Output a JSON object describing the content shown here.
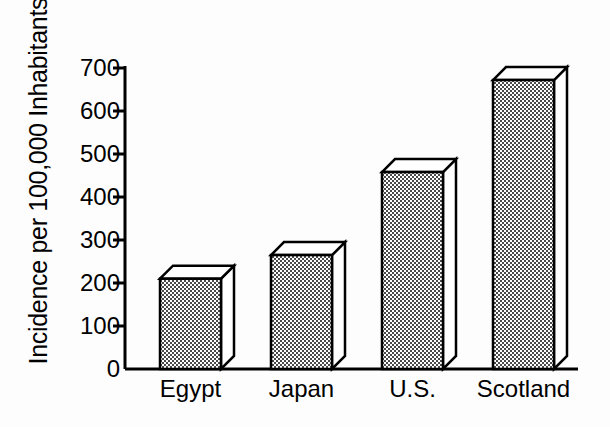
{
  "chart_data": {
    "type": "bar",
    "title": "",
    "subtitle": "",
    "xlabel": "",
    "ylabel": "Incidence per 100,000 Inhabitants",
    "categories": [
      "Egypt",
      "Japan",
      "U.S.",
      "Scotland"
    ],
    "values": [
      210,
      265,
      458,
      672
    ],
    "series": [
      {
        "name": "Incidence per 100,000 Inhabitants",
        "values": [
          210,
          265,
          458,
          672
        ]
      }
    ],
    "ylim": [
      0,
      700
    ],
    "ytick_values": [
      0,
      100,
      200,
      300,
      400,
      500,
      600,
      700
    ],
    "ytick_labels": [
      "0",
      "100",
      "200",
      "300",
      "400",
      "500",
      "600",
      "700"
    ],
    "grid": false,
    "legend": false,
    "legend_position": "none",
    "style": {
      "bar_fill_pattern": "fine-checkerboard-dots",
      "bar_fill_color": "#d8d8d8",
      "bar_edge_color": "#000000",
      "top_face_color": "#ffffff",
      "side_face_color": "#ffffff",
      "axis_color": "#000000",
      "background_color": "#ffffff",
      "three_d": true
    }
  },
  "axes": {
    "y_title": "Incidence per 100,000 Inhabitants",
    "ticks": [
      {
        "label": "700",
        "value": 700
      },
      {
        "label": "600",
        "value": 600
      },
      {
        "label": "500",
        "value": 500
      },
      {
        "label": "400",
        "value": 400
      },
      {
        "label": "300",
        "value": 300
      },
      {
        "label": "200",
        "value": 200
      },
      {
        "label": "100",
        "value": 100
      },
      {
        "label": "0",
        "value": 0
      }
    ]
  },
  "bars": [
    {
      "label": "Egypt",
      "value": 210
    },
    {
      "label": "Japan",
      "value": 265
    },
    {
      "label": "U.S.",
      "value": 458
    },
    {
      "label": "Scotland",
      "value": 672
    }
  ]
}
